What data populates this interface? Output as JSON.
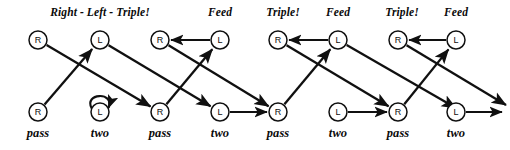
{
  "figure": {
    "background_color": "#ffffff",
    "stroke_color": "#101010",
    "width": 510,
    "height": 150
  },
  "phase_labels": [
    {
      "text": "Right - Left - Triple!",
      "x": 100,
      "y": 6
    },
    {
      "text": "Feed",
      "x": 220,
      "y": 6
    },
    {
      "text": "Triple!",
      "x": 283,
      "y": 6
    },
    {
      "text": "Feed",
      "x": 338,
      "y": 6
    },
    {
      "text": "Triple!",
      "x": 402,
      "y": 6
    },
    {
      "text": "Feed",
      "x": 456,
      "y": 6
    }
  ],
  "move_labels": [
    {
      "text": "pass",
      "x": 38,
      "y": 126
    },
    {
      "text": "two",
      "x": 100,
      "y": 126
    },
    {
      "text": "pass",
      "x": 160,
      "y": 126
    },
    {
      "text": "two",
      "x": 220,
      "y": 126
    },
    {
      "text": "pass",
      "x": 278,
      "y": 126
    },
    {
      "text": "two",
      "x": 338,
      "y": 126
    },
    {
      "text": "pass",
      "x": 398,
      "y": 126
    },
    {
      "text": "two",
      "x": 456,
      "y": 126
    }
  ],
  "top_nodes": [
    {
      "label": "R",
      "x": 38,
      "y": 40
    },
    {
      "label": "L",
      "x": 100,
      "y": 40
    },
    {
      "label": "R",
      "x": 160,
      "y": 40
    },
    {
      "label": "L",
      "x": 220,
      "y": 40
    },
    {
      "label": "R",
      "x": 278,
      "y": 40
    },
    {
      "label": "L",
      "x": 338,
      "y": 40
    },
    {
      "label": "R",
      "x": 398,
      "y": 40
    },
    {
      "label": "L",
      "x": 456,
      "y": 40
    }
  ],
  "bottom_nodes": [
    {
      "label": "R",
      "x": 38,
      "y": 112
    },
    {
      "label": "L",
      "x": 100,
      "y": 112
    },
    {
      "label": "R",
      "x": 160,
      "y": 112
    },
    {
      "label": "L",
      "x": 220,
      "y": 112
    },
    {
      "label": "R",
      "x": 278,
      "y": 112
    },
    {
      "label": "L",
      "x": 338,
      "y": 112
    },
    {
      "label": "R",
      "x": 398,
      "y": 112
    },
    {
      "label": "L",
      "x": 456,
      "y": 112
    }
  ],
  "node_radius": 9,
  "edges": {
    "top_horizontal": [
      {
        "from_x": 220,
        "to_x": 160,
        "y": 40
      },
      {
        "from_x": 338,
        "to_x": 278,
        "y": 40
      },
      {
        "from_x": 456,
        "to_x": 398,
        "y": 40
      }
    ],
    "bottom_horizontal": [
      {
        "from_x": 220,
        "to_x": 278,
        "y": 112
      },
      {
        "from_x": 338,
        "to_x": 398,
        "y": 112
      },
      {
        "from_x": 456,
        "to_x": 502,
        "y": 112,
        "open_end": true
      }
    ],
    "diagonal_up": [
      {
        "from_x": 38,
        "from_y": 112,
        "to_x": 100,
        "to_y": 40
      },
      {
        "from_x": 160,
        "from_y": 112,
        "to_x": 220,
        "to_y": 40
      },
      {
        "from_x": 278,
        "from_y": 112,
        "to_x": 338,
        "to_y": 40
      },
      {
        "from_x": 398,
        "from_y": 112,
        "to_x": 456,
        "to_y": 40
      }
    ],
    "diagonal_down": [
      {
        "from_x": 38,
        "from_y": 40,
        "to_x": 160,
        "to_y": 112
      },
      {
        "from_x": 100,
        "from_y": 40,
        "to_x": 220,
        "to_y": 112
      },
      {
        "from_x": 160,
        "from_y": 40,
        "to_x": 278,
        "to_y": 112
      },
      {
        "from_x": 278,
        "from_y": 40,
        "to_x": 398,
        "to_y": 112
      },
      {
        "from_x": 398,
        "from_y": 40,
        "to_x": 506,
        "to_y": 105,
        "open_end": true
      },
      {
        "from_x": 338,
        "from_y": 40,
        "to_x": 456,
        "to_y": 108,
        "open_end": true
      }
    ],
    "self_loops": [
      {
        "x": 100,
        "y": 112,
        "note": "loop above node, arrowhead returning from the right"
      }
    ]
  }
}
